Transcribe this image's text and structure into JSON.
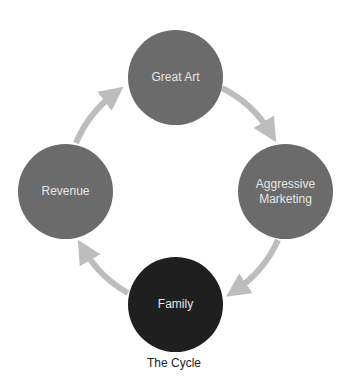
{
  "diagram": {
    "title": "The Cycle",
    "type": "cycle",
    "nodes": [
      {
        "label": "Great Art",
        "color": "#6b6b6b"
      },
      {
        "label": "Aggressive Marketing",
        "color": "#6b6b6b"
      },
      {
        "label": "Family",
        "color": "#1f1f1f"
      },
      {
        "label": "Revenue",
        "color": "#6b6b6b"
      }
    ],
    "edges": [
      {
        "from": "Great Art",
        "to": "Aggressive Marketing"
      },
      {
        "from": "Aggressive Marketing",
        "to": "Family"
      },
      {
        "from": "Family",
        "to": "Revenue"
      },
      {
        "from": "Revenue",
        "to": "Great Art"
      }
    ],
    "arrow_color": "#bdbdbd"
  }
}
